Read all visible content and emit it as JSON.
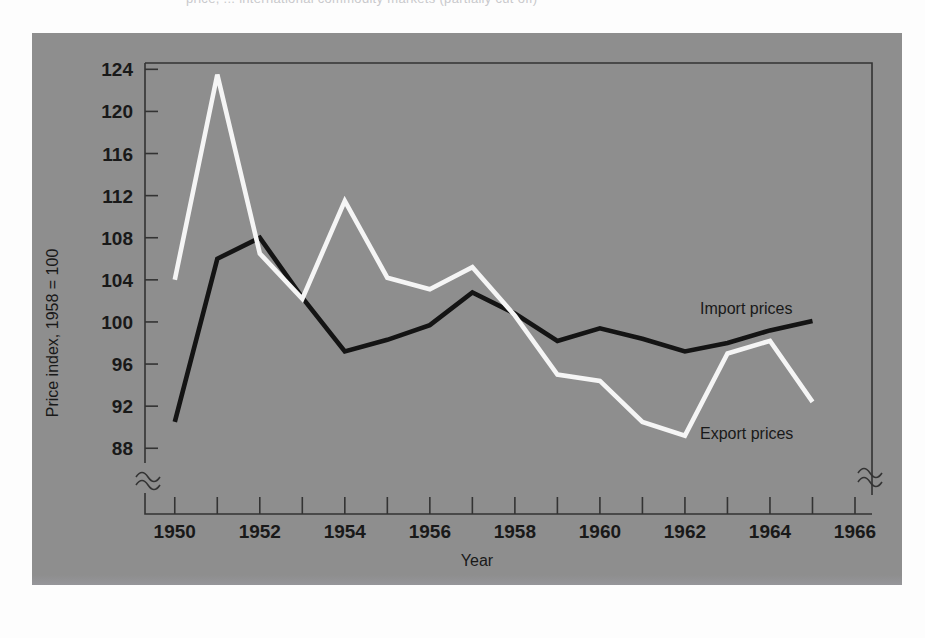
{
  "caption": {
    "text": "price, ... international commodity markets (partially cut off)"
  },
  "figure": {
    "background_color": "#8e8e8e",
    "frame_color": "#333333",
    "page_color": "#fdfdfd"
  },
  "chart_data": {
    "type": "line",
    "title": "",
    "xlabel": "Year",
    "ylabel": "Price index, 1958 = 100",
    "xlim": [
      1949.3,
      1966.4
    ],
    "ylim": [
      86.6,
      124.6
    ],
    "xticks": [
      1950,
      1952,
      1954,
      1956,
      1958,
      1960,
      1962,
      1964,
      1966
    ],
    "xtick_labels": [
      "1950",
      "1952",
      "1954",
      "1956",
      "1958",
      "1960",
      "1962",
      "1964",
      "1966"
    ],
    "xminor_ticks": [
      1951,
      1953,
      1955,
      1957,
      1959,
      1961,
      1963,
      1965
    ],
    "yticks": [
      88,
      92,
      96,
      100,
      104,
      108,
      112,
      116,
      120,
      124
    ],
    "ytick_labels": [
      "88",
      "92",
      "96",
      "100",
      "104",
      "108",
      "112",
      "116",
      "120",
      "124"
    ],
    "grid": false,
    "axis_break_y": true,
    "axis_break_x": true,
    "legend_position": "inline-right",
    "x": [
      1950,
      1951,
      1952,
      1953,
      1954,
      1955,
      1956,
      1957,
      1958,
      1959,
      1960,
      1961,
      1962,
      1963,
      1964,
      1965
    ],
    "series": [
      {
        "name": "Import prices",
        "color": "#141414",
        "values": [
          90.5,
          106.0,
          108.0,
          102.3,
          97.2,
          98.3,
          99.7,
          102.8,
          100.8,
          98.2,
          99.4,
          98.4,
          97.2,
          98.0,
          99.2,
          100.1
        ]
      },
      {
        "name": "Export prices",
        "color": "#f5f5f5",
        "values": [
          104.0,
          123.5,
          106.5,
          102.2,
          111.5,
          104.2,
          103.1,
          105.2,
          100.6,
          95.0,
          94.4,
          90.5,
          89.2,
          97.0,
          98.2,
          92.4
        ]
      }
    ]
  },
  "annotations": [
    {
      "name": "import-prices-label",
      "label": "Import prices"
    },
    {
      "name": "export-prices-label",
      "label": "Export prices"
    }
  ]
}
